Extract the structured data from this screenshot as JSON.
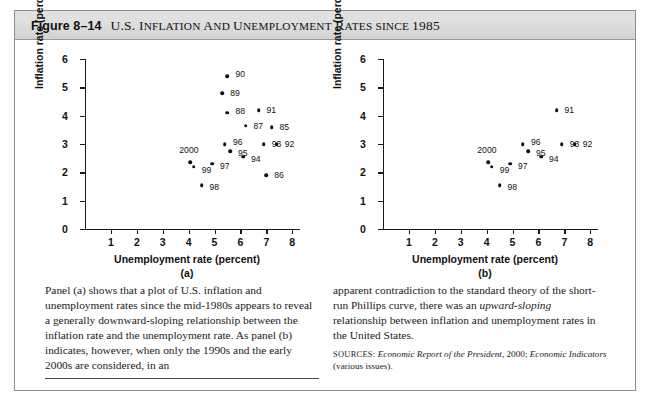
{
  "figure": {
    "number": "Figure 8–14",
    "title_parts": {
      "us": "U.S. ",
      "caps_1": "I",
      "sc_1": "NFLATION",
      "and_c": " A",
      "and_sc": "ND ",
      "caps_2": "U",
      "sc_2": "NEMPLOYMENT",
      "caps_3": " R",
      "sc_3": "ATES",
      "since_sc": " SINCE ",
      "year": "1985"
    },
    "title_plain": "U.S. INFLATION AND UNEMPLOYMENT RATES SINCE 1985"
  },
  "axis": {
    "xlabel": "Unemployment rate (percent)",
    "ylabel": "Inflation rate (percent)",
    "xticks": [
      "1",
      "2",
      "3",
      "4",
      "5",
      "6",
      "7",
      "8"
    ],
    "yticks": [
      "0",
      "1",
      "2",
      "3",
      "4",
      "5",
      "6"
    ]
  },
  "panels": {
    "a_id": "(a)",
    "b_id": "(b)"
  },
  "chart_data": [
    {
      "type": "scatter",
      "panel": "(a)",
      "title": "U.S. Inflation and Unemployment Rates since 1985",
      "xlabel": "Unemployment rate (percent)",
      "ylabel": "Inflation rate (percent)",
      "xlim": [
        0,
        8.3
      ],
      "ylim": [
        0,
        6
      ],
      "grid": false,
      "legend": "none",
      "points": [
        {
          "label": "85",
          "x": 7.2,
          "y": 3.6,
          "lx": 8,
          "ly": 0
        },
        {
          "label": "86",
          "x": 7.0,
          "y": 1.9,
          "lx": 8,
          "ly": 0
        },
        {
          "label": "87",
          "x": 6.2,
          "y": 3.65,
          "lx": 8,
          "ly": 0
        },
        {
          "label": "88",
          "x": 5.5,
          "y": 4.1,
          "lx": 8,
          "ly": -2
        },
        {
          "label": "89",
          "x": 5.3,
          "y": 4.8,
          "lx": 8,
          "ly": 0
        },
        {
          "label": "90",
          "x": 5.5,
          "y": 5.4,
          "lx": 8,
          "ly": -2
        },
        {
          "label": "91",
          "x": 6.7,
          "y": 4.2,
          "lx": 8,
          "ly": 0
        },
        {
          "label": "92",
          "x": 7.4,
          "y": 3.0,
          "lx": 8,
          "ly": 0
        },
        {
          "label": "93",
          "x": 6.9,
          "y": 3.0,
          "lx": 8,
          "ly": 0
        },
        {
          "label": "94",
          "x": 6.1,
          "y": 2.55,
          "lx": 8,
          "ly": 2
        },
        {
          "label": "95",
          "x": 5.6,
          "y": 2.75,
          "lx": 8,
          "ly": 2
        },
        {
          "label": "96",
          "x": 5.4,
          "y": 3.0,
          "lx": 8,
          "ly": -2
        },
        {
          "label": "97",
          "x": 4.9,
          "y": 2.3,
          "lx": 8,
          "ly": 2
        },
        {
          "label": "98",
          "x": 4.5,
          "y": 1.55,
          "lx": 8,
          "ly": 2
        },
        {
          "label": "99",
          "x": 4.2,
          "y": 2.2,
          "lx": 8,
          "ly": 3
        },
        {
          "label": "2000",
          "x": 4.05,
          "y": 2.35,
          "lx": -1,
          "ly": -12,
          "anchor": "above"
        }
      ]
    },
    {
      "type": "scatter",
      "panel": "(b)",
      "title": "U.S. Inflation and Unemployment Rates, 1991–2000",
      "xlabel": "Unemployment rate (percent)",
      "ylabel": "Inflation rate (percent)",
      "xlim": [
        0,
        8.3
      ],
      "ylim": [
        0,
        6
      ],
      "grid": false,
      "legend": "none",
      "points": [
        {
          "label": "91",
          "x": 6.7,
          "y": 4.2,
          "lx": 8,
          "ly": 0
        },
        {
          "label": "92",
          "x": 7.4,
          "y": 3.0,
          "lx": 8,
          "ly": 0
        },
        {
          "label": "93",
          "x": 6.9,
          "y": 3.0,
          "lx": 8,
          "ly": 0
        },
        {
          "label": "94",
          "x": 6.1,
          "y": 2.55,
          "lx": 8,
          "ly": 2
        },
        {
          "label": "95",
          "x": 5.6,
          "y": 2.75,
          "lx": 8,
          "ly": 2
        },
        {
          "label": "96",
          "x": 5.4,
          "y": 3.0,
          "lx": 8,
          "ly": -2
        },
        {
          "label": "97",
          "x": 4.9,
          "y": 2.3,
          "lx": 8,
          "ly": 2
        },
        {
          "label": "98",
          "x": 4.5,
          "y": 1.55,
          "lx": 8,
          "ly": 2
        },
        {
          "label": "99",
          "x": 4.2,
          "y": 2.2,
          "lx": 8,
          "ly": 3
        },
        {
          "label": "2000",
          "x": 4.05,
          "y": 2.35,
          "lx": -1,
          "ly": -12,
          "anchor": "above"
        }
      ]
    }
  ],
  "caption": {
    "left": "Panel (a) shows that a plot of U.S. inflation and unemployment rates since the mid-1980s appears to reveal a generally downward-sloping relationship between the inflation rate and the unemployment rate. As panel (b) indicates, however, when only the 1990s and the early 2000s are considered, in an",
    "right_1": "apparent contradiction to the standard theory of the short-run Phillips curve, there was an ",
    "right_em": "upward-sloping",
    "right_2": " relationship between inflation and unemployment rates in the United States.",
    "sources_label": "SOURCES:",
    "sources_i1": "Economic Report of the President,",
    "sources_t1": " 2000; ",
    "sources_i2": "Economic Indicators",
    "sources_t2": " (various issues)."
  },
  "colors": {
    "dot": "#111111",
    "axis": "#1a1a1a",
    "titlebar": "#dedede",
    "border": "#8d8d8d"
  }
}
